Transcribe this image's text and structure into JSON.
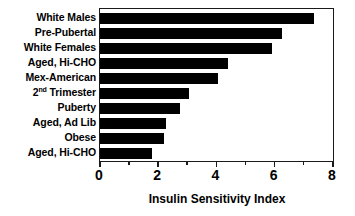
{
  "chart_data": {
    "type": "bar",
    "orientation": "horizontal",
    "title": "",
    "xlabel": "Insulin Sensitivity Index",
    "ylabel": "",
    "xlim": [
      0,
      8
    ],
    "ylim": null,
    "grid": false,
    "legend": null,
    "bar_color": "#000000",
    "x_ticks": [
      "0",
      "2",
      "4",
      "6",
      "8"
    ],
    "x_tick_values": [
      0,
      2,
      4,
      6,
      8
    ],
    "x_minor_tick_values": [
      1,
      3,
      5,
      7
    ],
    "categories": [
      "White Males",
      "Pre-Pubertal",
      "White Females",
      "Aged, Hi-CHO",
      "Mex-American",
      "2nd Trimester",
      "Puberty",
      "Aged, Ad Lib",
      "Obese",
      "Aged, Hi-CHO"
    ],
    "values": [
      7.35,
      6.25,
      5.9,
      4.4,
      4.05,
      3.05,
      2.75,
      2.25,
      2.2,
      1.8
    ],
    "bars": [
      {
        "label": "White Males",
        "label_html": "White Males",
        "value": 7.35
      },
      {
        "label": "Pre-Pubertal",
        "label_html": "Pre-Pubertal",
        "value": 6.25
      },
      {
        "label": "White Females",
        "label_html": "White Females",
        "value": 5.9
      },
      {
        "label": "Aged, Hi-CHO",
        "label_html": "Aged, Hi-CHO",
        "value": 4.4
      },
      {
        "label": "Mex-American",
        "label_html": "Mex-American",
        "value": 4.05
      },
      {
        "label": "2nd Trimester",
        "label_html": "2<sup>nd</sup>&nbsp;Trimester",
        "value": 3.05
      },
      {
        "label": "Puberty",
        "label_html": "Puberty",
        "value": 2.75
      },
      {
        "label": "Aged, Ad Lib",
        "label_html": "Aged, Ad Lib",
        "value": 2.25
      },
      {
        "label": "Obese",
        "label_html": "Obese",
        "value": 2.2
      },
      {
        "label": "Aged, Hi-CHO",
        "label_html": "Aged, Hi-CHO",
        "value": 1.8
      }
    ]
  }
}
